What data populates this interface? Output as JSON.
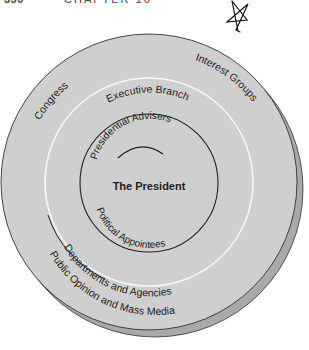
{
  "header": {
    "page_number": "330",
    "chapter": "CHAPTER 10"
  },
  "diagram": {
    "title": "The President",
    "colors": {
      "disc_fill": "#cfcfcf",
      "shadow_fill": "#a9a9a9",
      "outline": "#333333",
      "white_ring": "#f4f4f4",
      "text": "#1e1e1e"
    },
    "rings": {
      "outer": {
        "labels": [
          "Congress",
          "Interest Groups",
          "Public Opinion and Mass Media"
        ]
      },
      "middle": {
        "labels": [
          "Executive Branch",
          "Departments and Agencies"
        ]
      },
      "inner": {
        "labels": [
          "Presidential Advisers",
          "Political Appointees"
        ]
      },
      "center": {
        "label": "The President"
      }
    },
    "annotation": "hand-drawn star"
  }
}
